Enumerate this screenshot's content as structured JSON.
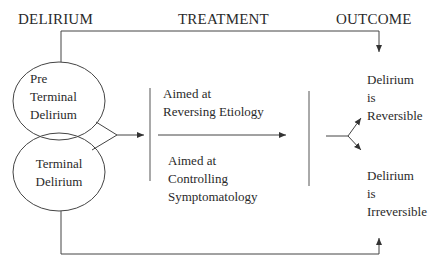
{
  "headers": {
    "delirium": "DELIRIUM",
    "treatment": "TREATMENT",
    "outcome": "OUTCOME"
  },
  "nodes": {
    "pre_terminal": [
      "Pre",
      "Terminal",
      "Delirium"
    ],
    "terminal": [
      "Terminal",
      "Delirium"
    ],
    "treatment_reversing": [
      "Aimed at",
      "Reversing Etiology"
    ],
    "treatment_controlling": [
      "Aimed at",
      "Controlling",
      "Symptomatology"
    ],
    "outcome_reversible": [
      "Delirium",
      "is",
      "Reversible"
    ],
    "outcome_irreversible": [
      "Delirium",
      "is",
      "Irreversible"
    ]
  },
  "colors": {
    "line": "#3a3a3a",
    "text": "#2a2a2a",
    "background": "#ffffff"
  }
}
